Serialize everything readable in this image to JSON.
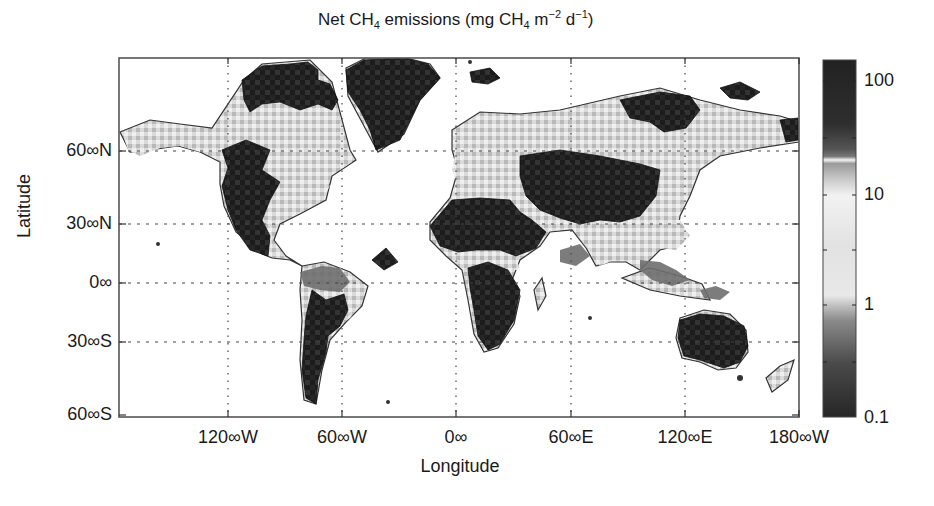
{
  "chart_data": {
    "type": "heatmap",
    "title_parts": {
      "pre": "Net CH",
      "sub1": "4",
      "mid": " emissions (mg CH",
      "sub2": "4",
      "mid2": " m",
      "sup1": "−2",
      "mid3": " d",
      "sup2": "−1",
      "post": ")"
    },
    "xlabel": "Longitude",
    "ylabel": "Latitude",
    "x_ticks": [
      {
        "label": "120∞∞W",
        "text": "120∞W",
        "x": 228
      },
      {
        "label": "60∞W",
        "text": "60∞W",
        "x": 342
      },
      {
        "label": "0∞",
        "text": "0∞",
        "x": 456
      },
      {
        "label": "60∞E",
        "text": "60∞E",
        "x": 571
      },
      {
        "label": "120∞E",
        "text": "120∞E",
        "x": 685
      },
      {
        "label": "180∞W",
        "text": "180∞W",
        "x": 799
      }
    ],
    "y_ticks": [
      {
        "text": "60∞N",
        "y": 151
      },
      {
        "text": "30∞N",
        "y": 224
      },
      {
        "text": "0∞",
        "y": 283
      },
      {
        "text": "30∞S",
        "y": 342
      },
      {
        "text": "60∞S",
        "y": 415
      }
    ],
    "colorbar": {
      "scale": "log",
      "range": [
        0.1,
        200
      ],
      "ticks": [
        {
          "text": "100",
          "y": 81
        },
        {
          "text": "10",
          "y": 195
        },
        {
          "text": "1",
          "y": 305
        },
        {
          "text": "0.1",
          "y": 418
        }
      ],
      "colormap_note": "dark (0.1) -> gray -> light (1-10) -> white line ~20 -> dark gray/black (100+)"
    },
    "grid": "dotted",
    "projection_note": "global land grid map, ocean blank",
    "regions_description": [
      {
        "region": "Greenland",
        "level": "high (>100)"
      },
      {
        "region": "Canadian Arctic Archipelago",
        "level": "high"
      },
      {
        "region": "Alaska / N Canada boreal",
        "level": "moderate (2-10) with scattered high"
      },
      {
        "region": "Western USA / Mexico",
        "level": "high"
      },
      {
        "region": "Eastern USA",
        "level": "moderate-light"
      },
      {
        "region": "Amazon basin",
        "level": "moderate (1-10)"
      },
      {
        "region": "Southern South America / Andes",
        "level": "high with patches"
      },
      {
        "region": "Sahara / N Africa / Middle East",
        "level": "high"
      },
      {
        "region": "Central Africa",
        "level": "moderate"
      },
      {
        "region": "Southern Africa",
        "level": "high"
      },
      {
        "region": "Siberia / N Eurasia",
        "level": "moderate with patches high"
      },
      {
        "region": "Central Asia / Tibet",
        "level": "high"
      },
      {
        "region": "India / SE Asia",
        "level": "moderate"
      },
      {
        "region": "Australia",
        "level": "high"
      }
    ]
  },
  "colors": {
    "frame": "#555555",
    "dark": "#1c1c1c",
    "mid": "#6e6e6e",
    "light": "#d6d6d6",
    "pale": "#ececec",
    "grid": "#444444"
  },
  "shapes": {
    "dark": [
      "M 242 80 L 262 66 L 290 64 L 308 62 L 318 70 L 318 80 L 330 84 L 338 100 L 332 110 L 318 104 L 300 110 L 280 102 L 262 104 L 250 112 L 244 100 Z",
      "M 346 70 L 364 60 L 404 58 L 428 64 L 440 78 L 420 100 L 410 120 L 400 140 L 376 150 L 370 130 L 360 110 L 348 92 Z",
      "M 222 150 L 246 140 L 270 150 L 262 170 L 280 182 L 270 200 L 262 220 L 270 236 L 268 256 L 250 250 L 236 230 L 228 210 L 222 186 L 228 168 Z",
      "M 312 290 L 326 300 L 344 294 L 348 310 L 340 326 L 328 336 L 326 352 L 318 380 L 316 404 L 306 398 L 302 370 L 304 340 L 306 316 Z",
      "M 372 260 L 386 248 L 398 262 L 384 270 Z",
      "M 430 226 L 452 200 L 480 198 L 510 200 L 520 212 L 532 220 L 546 232 L 536 248 L 516 256 L 500 250 L 476 250 L 458 252 L 440 246 Z",
      "M 468 268 L 488 262 L 508 270 L 520 290 L 514 320 L 500 344 L 488 350 L 478 336 L 474 310 L 470 288 Z",
      "M 520 156 L 560 150 L 600 156 L 640 164 L 660 170 L 656 196 L 640 216 L 620 222 L 600 220 L 580 224 L 560 218 L 540 210 L 526 196 L 520 176 Z",
      "M 680 320 L 700 314 L 724 316 L 744 326 L 748 346 L 740 362 L 724 368 L 700 360 L 684 356 L 678 338 Z",
      "M 620 100 L 660 92 L 690 96 L 700 110 L 686 128 L 664 132 L 650 122 L 630 118 Z",
      "M 470 72 L 490 68 L 500 78 L 488 84 L 472 82 Z",
      "M 720 88 L 740 82 L 760 92 L 748 100 L 730 98 Z",
      "M 780 120 L 798 118 L 798 140 L 786 142 Z"
    ],
    "mid": [
      "M 300 272 L 322 266 L 340 268 L 350 282 L 340 292 L 320 290 L 304 286 Z",
      "M 560 250 L 580 244 L 590 256 L 576 266 L 560 262 Z",
      "M 640 260 L 660 262 L 676 270 L 690 280 L 672 286 L 652 280 L 640 270 Z",
      "M 700 290 L 716 286 L 730 292 L 720 300 L 704 298 Z",
      "M 600 190 L 620 184 L 640 196 L 624 206 L 606 204 Z"
    ],
    "light": [
      "M 122 132 L 150 122 L 180 126 L 210 130 L 240 126 L 262 122 L 290 126 L 312 130 L 330 142 L 346 150 L 352 162 L 340 170 L 320 172 L 300 166 L 286 160 L 270 150 L 246 140 L 222 150 L 200 152 L 180 146 L 160 148 L 140 156 L 128 150 Z",
      "M 270 150 L 296 160 L 316 174 L 330 186 L 322 200 L 306 210 L 290 216 L 278 222 L 270 236 L 262 220 L 270 200 L 280 182 L 262 170 Z",
      "M 312 270 L 340 268 L 356 278 L 366 290 L 360 306 L 350 318 L 340 326 L 348 310 L 344 294 L 326 300 L 312 290 Z",
      "M 460 130 L 480 118 L 500 114 L 520 120 L 530 130 L 520 150 L 520 176 L 526 196 L 510 200 L 480 198 L 460 190 L 452 170 L 456 150 Z",
      "M 530 120 L 560 112 L 600 108 L 620 100 L 630 118 L 650 122 L 664 132 L 686 128 L 700 110 L 720 120 L 760 118 L 780 120 L 786 142 L 760 146 L 720 150 L 700 160 L 680 164 L 660 170 L 640 164 L 600 156 L 560 150 L 530 150 Z",
      "M 456 254 L 476 250 L 500 250 L 516 256 L 520 270 L 508 270 L 488 262 L 468 268 Z",
      "M 584 230 L 610 224 L 626 240 L 614 260 L 600 266 L 590 250 Z",
      "M 640 220 L 660 214 L 680 220 L 690 236 L 676 250 L 660 248 L 646 240 Z"
    ],
    "outlines": [
      "M 120 132 L 150 120 L 180 124 L 212 128 L 244 80 L 262 64 L 310 60 L 332 82 L 350 150 L 356 160 L 332 176 L 326 200 L 300 214 L 280 224 L 274 240 L 286 256 L 302 266 L 290 260 L 272 258 L 262 254 L 236 232 L 224 206 L 220 184 L 220 162 L 200 152 L 178 146 L 150 150 L 130 152 Z",
      "M 302 266 L 324 262 L 350 272 L 368 286 L 362 306 L 346 322 L 330 340 L 322 370 L 316 404 L 304 400 L 300 360 L 302 320 L 300 290 Z",
      "M 346 68 L 366 58 L 406 58 L 430 64 L 440 78 L 420 100 L 404 134 L 378 152 L 364 126 L 348 96 Z",
      "M 452 130 L 480 112 L 520 114 L 560 110 L 620 96 L 660 88 L 700 100 L 740 110 L 780 116 L 799 122 L 799 142 L 760 148 L 720 156 L 700 170 L 690 196 L 680 216 L 676 246 L 660 250 L 640 270 L 626 262 L 610 262 L 596 266 L 586 248 L 572 230 L 550 232 L 540 246 L 520 260 L 512 280 L 520 296 L 514 324 L 498 348 L 484 352 L 474 334 L 468 300 L 462 270 L 446 256 L 430 240 L 430 222 L 450 198 L 458 170 L 452 150 Z",
      "M 680 318 L 704 310 L 730 314 L 746 330 L 748 352 L 736 368 L 718 370 L 700 362 L 682 358 L 676 338 Z",
      "M 534 290 L 542 278 L 546 296 L 538 310 Z",
      "M 622 278 L 650 268 L 680 276 L 702 284 L 710 300 L 680 296 L 650 290 Z",
      "M 766 378 L 780 366 L 794 360 L 788 380 L 772 392 Z"
    ],
    "islands": [
      {
        "cx": 158,
        "cy": 244,
        "r": 2
      },
      {
        "cx": 740,
        "cy": 378,
        "r": 3
      },
      {
        "cx": 470,
        "cy": 62,
        "r": 2
      },
      {
        "cx": 590,
        "cy": 318,
        "r": 2
      },
      {
        "cx": 388,
        "cy": 402,
        "r": 2
      }
    ]
  }
}
